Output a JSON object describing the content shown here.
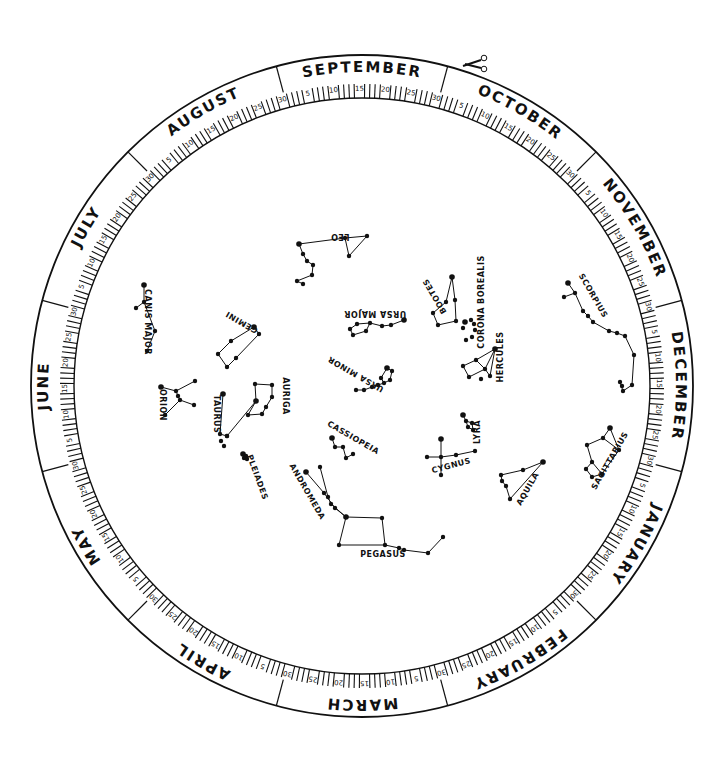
{
  "wheel": {
    "center": [
      362,
      386
    ],
    "outer_radius": 331,
    "divider_radius": 305,
    "inner_radius": 288,
    "month_start_angle": -105,
    "ink_color": "#111111",
    "background": "#ffffff",
    "months": [
      "SEPTEMBER",
      "OCTOBER",
      "NOVEMBER",
      "DECEMBER",
      "JANUARY",
      "FEBRUARY",
      "MARCH",
      "APRIL",
      "MAY",
      "JUNE",
      "JULY",
      "AUGUST"
    ],
    "day_marks": [
      "5",
      "10",
      "15",
      "20",
      "25",
      "30"
    ],
    "cut_icon": "scissors-icon"
  },
  "constellations": [
    {
      "name": "LEO",
      "label_pos": [
        340,
        234
      ],
      "label_rot": 180,
      "stars": [
        [
          299,
          244
        ],
        [
          345,
          238
        ],
        [
          367,
          236
        ],
        [
          349,
          256
        ],
        [
          303,
          254
        ],
        [
          307,
          261
        ],
        [
          313,
          265
        ],
        [
          312,
          275
        ],
        [
          297,
          281
        ],
        [
          303,
          284
        ]
      ],
      "lines": [
        [
          0,
          1
        ],
        [
          1,
          2
        ],
        [
          2,
          3
        ],
        [
          3,
          1
        ],
        [
          0,
          4
        ],
        [
          4,
          5
        ],
        [
          5,
          6
        ],
        [
          6,
          7
        ],
        [
          7,
          8
        ],
        [
          8,
          9
        ]
      ]
    },
    {
      "name": "CANIS MAJOR",
      "label_pos": [
        145,
        322
      ],
      "label_rot": 90,
      "stars": [
        [
          144,
          285
        ],
        [
          144,
          302
        ],
        [
          136,
          308
        ],
        [
          155,
          331
        ],
        [
          147,
          351
        ]
      ],
      "lines": [
        [
          0,
          1
        ],
        [
          1,
          2
        ],
        [
          1,
          3
        ],
        [
          3,
          4
        ]
      ]
    },
    {
      "name": "GEMINI",
      "label_pos": [
        243,
        320
      ],
      "label_rot": 210,
      "stars": [
        [
          254,
          327
        ],
        [
          259,
          334
        ],
        [
          231,
          341
        ],
        [
          218,
          354
        ],
        [
          236,
          358
        ],
        [
          227,
          367
        ]
      ],
      "lines": [
        [
          0,
          1
        ],
        [
          0,
          2
        ],
        [
          2,
          3
        ],
        [
          3,
          5
        ],
        [
          5,
          4
        ],
        [
          4,
          1
        ]
      ]
    },
    {
      "name": "ORION",
      "label_pos": [
        160,
        405
      ],
      "label_rot": 90,
      "stars": [
        [
          161,
          387
        ],
        [
          176,
          391
        ],
        [
          195,
          381
        ],
        [
          178,
          396
        ],
        [
          180,
          400
        ],
        [
          194,
          405
        ],
        [
          165,
          415
        ]
      ],
      "lines": [
        [
          0,
          1
        ],
        [
          1,
          2
        ],
        [
          1,
          3
        ],
        [
          3,
          4
        ],
        [
          4,
          5
        ],
        [
          4,
          6
        ]
      ]
    },
    {
      "name": "TAURUS",
      "label_pos": [
        214,
        414
      ],
      "label_rot": 90,
      "stars": [
        [
          223,
          394
        ],
        [
          220,
          434
        ],
        [
          227,
          436
        ],
        [
          221,
          441
        ],
        [
          224,
          446
        ]
      ],
      "lines": [
        [
          0,
          1
        ],
        [
          1,
          2
        ]
      ]
    },
    {
      "name": "AURIGA",
      "label_pos": [
        283,
        396
      ],
      "label_rot": 90,
      "stars": [
        [
          256,
          401
        ],
        [
          255,
          384
        ],
        [
          272,
          385
        ],
        [
          272,
          397
        ],
        [
          266,
          407
        ],
        [
          262,
          414
        ],
        [
          248,
          415
        ],
        [
          227,
          436
        ]
      ],
      "lines": [
        [
          0,
          1
        ],
        [
          1,
          2
        ],
        [
          2,
          3
        ],
        [
          3,
          4
        ],
        [
          4,
          5
        ],
        [
          5,
          6
        ],
        [
          6,
          0
        ],
        [
          0,
          7
        ]
      ]
    },
    {
      "name": "PLEIADES",
      "label_pos": [
        255,
        478
      ],
      "label_rot": 70,
      "stars": [
        [
          243,
          454
        ],
        [
          246,
          456
        ],
        [
          244,
          458
        ],
        [
          247,
          459
        ]
      ],
      "lines": []
    },
    {
      "name": "URSA MAJOR",
      "label_pos": [
        375,
        311
      ],
      "label_rot": 180,
      "stars": [
        [
          404,
          320
        ],
        [
          391,
          325
        ],
        [
          382,
          326
        ],
        [
          370,
          323
        ],
        [
          357,
          324
        ],
        [
          350,
          329
        ],
        [
          353,
          335
        ],
        [
          366,
          331
        ]
      ],
      "lines": [
        [
          0,
          1
        ],
        [
          1,
          2
        ],
        [
          2,
          3
        ],
        [
          3,
          4
        ],
        [
          4,
          5
        ],
        [
          5,
          6
        ],
        [
          6,
          7
        ],
        [
          7,
          3
        ]
      ]
    },
    {
      "name": "URSA MINOR",
      "label_pos": [
        357,
        372
      ],
      "label_rot": 210,
      "stars": [
        [
          387,
          368
        ],
        [
          392,
          371
        ],
        [
          390,
          380
        ],
        [
          384,
          383
        ],
        [
          381,
          378
        ],
        [
          378,
          385
        ],
        [
          372,
          387
        ],
        [
          364,
          390
        ],
        [
          356,
          390
        ]
      ],
      "lines": [
        [
          0,
          1
        ],
        [
          1,
          2
        ],
        [
          2,
          3
        ],
        [
          3,
          4
        ],
        [
          4,
          0
        ],
        [
          3,
          5
        ],
        [
          5,
          6
        ],
        [
          6,
          7
        ],
        [
          7,
          8
        ]
      ]
    },
    {
      "name": "BOOTES",
      "label_pos": [
        437,
        295
      ],
      "label_rot": 240,
      "stars": [
        [
          452,
          277
        ],
        [
          446,
          302
        ],
        [
          455,
          300
        ],
        [
          456,
          321
        ],
        [
          438,
          325
        ],
        [
          433,
          313
        ]
      ],
      "lines": [
        [
          0,
          1
        ],
        [
          0,
          2
        ],
        [
          2,
          3
        ],
        [
          3,
          4
        ],
        [
          4,
          5
        ],
        [
          5,
          1
        ]
      ]
    },
    {
      "name": "CORONA BOREALIS",
      "label_pos": [
        484,
        302
      ],
      "label_rot": 270,
      "stars": [
        [
          465,
          322
        ],
        [
          471,
          320
        ],
        [
          474,
          324
        ],
        [
          475,
          330
        ],
        [
          472,
          337
        ],
        [
          466,
          340
        ],
        [
          463,
          328
        ]
      ],
      "lines": []
    },
    {
      "name": "HERCULES",
      "label_pos": [
        503,
        357
      ],
      "label_rot": 270,
      "stars": [
        [
          495,
          349
        ],
        [
          476,
          360
        ],
        [
          463,
          366
        ],
        [
          469,
          377
        ],
        [
          485,
          369
        ],
        [
          490,
          376
        ],
        [
          481,
          379
        ]
      ],
      "lines": [
        [
          0,
          1
        ],
        [
          1,
          2
        ],
        [
          2,
          3
        ],
        [
          3,
          4
        ],
        [
          4,
          1
        ],
        [
          4,
          0
        ],
        [
          0,
          5
        ],
        [
          5,
          4
        ]
      ]
    },
    {
      "name": "SCORPIUS",
      "label_pos": [
        591,
        297
      ],
      "label_rot": 60,
      "stars": [
        [
          568,
          283
        ],
        [
          575,
          293
        ],
        [
          564,
          297
        ],
        [
          583,
          311
        ],
        [
          588,
          316
        ],
        [
          593,
          322
        ],
        [
          609,
          331
        ],
        [
          617,
          333
        ],
        [
          625,
          336
        ],
        [
          634,
          355
        ],
        [
          632,
          385
        ],
        [
          623,
          391
        ],
        [
          620,
          382
        ],
        [
          622,
          386
        ]
      ],
      "lines": [
        [
          0,
          1
        ],
        [
          1,
          2
        ],
        [
          1,
          3
        ],
        [
          3,
          4
        ],
        [
          4,
          5
        ],
        [
          5,
          6
        ],
        [
          6,
          7
        ],
        [
          7,
          8
        ],
        [
          8,
          9
        ],
        [
          9,
          10
        ],
        [
          10,
          11
        ],
        [
          11,
          12
        ]
      ]
    },
    {
      "name": "SAGITTARIUS",
      "label_pos": [
        612,
        462
      ],
      "label_rot": 300,
      "stars": [
        [
          610,
          428
        ],
        [
          603,
          438
        ],
        [
          587,
          445
        ],
        [
          619,
          450
        ],
        [
          592,
          462
        ],
        [
          586,
          469
        ],
        [
          602,
          474
        ],
        [
          592,
          477
        ]
      ],
      "lines": [
        [
          0,
          1
        ],
        [
          1,
          2
        ],
        [
          0,
          3
        ],
        [
          1,
          3
        ],
        [
          2,
          4
        ],
        [
          4,
          5
        ],
        [
          5,
          7
        ],
        [
          7,
          6
        ],
        [
          6,
          3
        ],
        [
          6,
          4
        ]
      ]
    },
    {
      "name": "CASSIOPEIA",
      "label_pos": [
        352,
        440
      ],
      "label_rot": 30,
      "stars": [
        [
          332,
          438
        ],
        [
          335,
          447
        ],
        [
          343,
          447
        ],
        [
          346,
          458
        ],
        [
          353,
          454
        ]
      ],
      "lines": [
        [
          0,
          1
        ],
        [
          1,
          2
        ],
        [
          2,
          3
        ],
        [
          3,
          4
        ]
      ]
    },
    {
      "name": "ANDROMEDA",
      "label_pos": [
        305,
        493
      ],
      "label_rot": 60,
      "stars": [
        [
          306,
          472
        ],
        [
          320,
          467
        ],
        [
          328,
          497
        ],
        [
          324,
          493
        ],
        [
          331,
          504
        ],
        [
          335,
          508
        ],
        [
          346,
          517
        ]
      ],
      "lines": [
        [
          0,
          3
        ],
        [
          3,
          5
        ],
        [
          5,
          6
        ],
        [
          1,
          2
        ],
        [
          2,
          4
        ],
        [
          4,
          6
        ]
      ]
    },
    {
      "name": "PEGASUS",
      "label_pos": [
        383,
        557
      ],
      "label_rot": 0,
      "stars": [
        [
          346,
          517
        ],
        [
          382,
          518
        ],
        [
          339,
          545
        ],
        [
          385,
          545
        ],
        [
          399,
          548
        ],
        [
          404,
          550
        ],
        [
          428,
          553
        ],
        [
          443,
          537
        ]
      ],
      "lines": [
        [
          0,
          1
        ],
        [
          1,
          3
        ],
        [
          3,
          2
        ],
        [
          2,
          0
        ],
        [
          3,
          4
        ],
        [
          4,
          5
        ],
        [
          5,
          6
        ],
        [
          6,
          7
        ]
      ]
    },
    {
      "name": "LYRA",
      "label_pos": [
        480,
        432
      ],
      "label_rot": 270,
      "stars": [
        [
          463,
          415
        ],
        [
          466,
          421
        ],
        [
          472,
          423
        ],
        [
          468,
          427
        ],
        [
          473,
          430
        ]
      ],
      "lines": [
        [
          0,
          1
        ],
        [
          1,
          2
        ],
        [
          2,
          4
        ],
        [
          4,
          3
        ],
        [
          3,
          1
        ]
      ]
    },
    {
      "name": "CYGNUS",
      "label_pos": [
        452,
        468
      ],
      "label_rot": 345,
      "stars": [
        [
          441,
          439
        ],
        [
          427,
          457
        ],
        [
          441,
          457
        ],
        [
          456,
          455
        ],
        [
          475,
          451
        ],
        [
          441,
          475
        ]
      ],
      "lines": [
        [
          0,
          2
        ],
        [
          2,
          5
        ],
        [
          1,
          2
        ],
        [
          2,
          3
        ],
        [
          3,
          4
        ]
      ]
    },
    {
      "name": "AQUILA",
      "label_pos": [
        530,
        490
      ],
      "label_rot": 300,
      "stars": [
        [
          543,
          462
        ],
        [
          523,
          470
        ],
        [
          501,
          475
        ],
        [
          502,
          481
        ],
        [
          506,
          486
        ],
        [
          510,
          499
        ]
      ],
      "lines": [
        [
          0,
          1
        ],
        [
          1,
          2
        ],
        [
          2,
          3
        ],
        [
          3,
          4
        ],
        [
          4,
          5
        ],
        [
          5,
          0
        ]
      ]
    }
  ]
}
